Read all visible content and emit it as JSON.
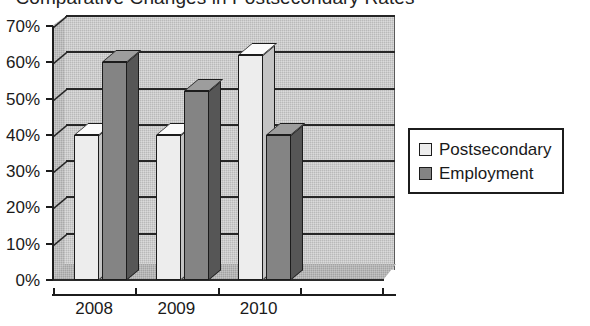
{
  "chart_data": {
    "type": "bar",
    "title": "Comparative Changes in Postsecondary Rates",
    "xlabel": "",
    "ylabel": "",
    "categories": [
      "2008",
      "2009",
      "2010",
      ""
    ],
    "series": [
      {
        "name": "Postsecondary",
        "color": "#ededed",
        "values": [
          40,
          40,
          62,
          null
        ]
      },
      {
        "name": "Employment",
        "color": "#848484",
        "values": [
          60,
          52,
          40,
          null
        ]
      }
    ],
    "ytick_labels": [
      "0%",
      "10%",
      "20%",
      "30%",
      "40%",
      "50%",
      "60%",
      "70%"
    ],
    "ytick_values": [
      0,
      10,
      20,
      30,
      40,
      50,
      60,
      70
    ],
    "ylim": [
      0,
      70
    ],
    "grid": true,
    "legend_position": "right",
    "style": "3d-clustered-column"
  },
  "legend": {
    "items": [
      {
        "label": "Postsecondary"
      },
      {
        "label": "Employment"
      }
    ]
  }
}
